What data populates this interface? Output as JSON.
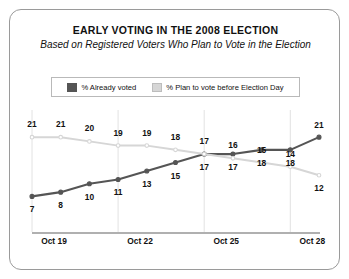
{
  "chart_data": {
    "type": "line",
    "title": "EARLY VOTING IN THE 2008 ELECTION",
    "subtitle": "Based on Registered Voters Who Plan to Vote in the Election",
    "xlabel": "",
    "ylabel": "",
    "ylim": [
      0,
      26
    ],
    "grid": true,
    "legend_position": "top",
    "x": [
      0,
      1,
      2,
      3,
      4,
      5,
      6,
      7,
      8,
      9,
      10
    ],
    "tick_indices": [
      0,
      3,
      6,
      9
    ],
    "tick_labels": [
      "Oct 19",
      "Oct 22",
      "Oct 25",
      "Oct 28"
    ],
    "series": [
      {
        "name": "% Already voted",
        "color": "#555555",
        "values": [
          7,
          8,
          10,
          11,
          13,
          15,
          17,
          17,
          18,
          18,
          21
        ],
        "label_side": "below"
      },
      {
        "name": "% Plan to vote before Election Day",
        "color": "#d6d6d6",
        "values": [
          21,
          21,
          20,
          19,
          19,
          18,
          17,
          16,
          15,
          14,
          12
        ],
        "label_side": "above"
      }
    ]
  },
  "card": {
    "border_color": "#9a9a9a",
    "background": "#ffffff"
  }
}
